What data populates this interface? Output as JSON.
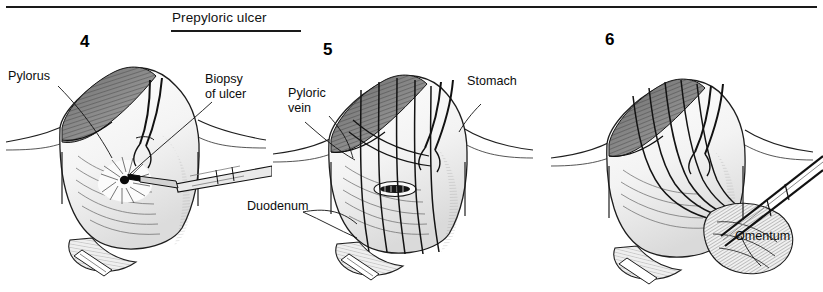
{
  "figure": {
    "title": "Prepyloric ulcer",
    "panels": [
      {
        "number": "4",
        "labels": [
          {
            "name": "pylorus",
            "text": "Pylorus"
          },
          {
            "name": "biopsy-of-ulcer",
            "text": "Biopsy\nof ulcer"
          }
        ]
      },
      {
        "number": "5",
        "labels": [
          {
            "name": "pyloric-vein",
            "text": "Pyloric\nvein"
          },
          {
            "name": "stomach",
            "text": "Stomach"
          },
          {
            "name": "duodenum",
            "text": "Duodenum"
          }
        ]
      },
      {
        "number": "6",
        "labels": [
          {
            "name": "omentum",
            "text": "Omentum"
          }
        ]
      }
    ]
  },
  "colors": {
    "ink": "#1a1a1a",
    "paper": "#ffffff",
    "shade_light": "#f2f2f2",
    "shade_mid": "#d8d8d8",
    "shade_dark": "#8c8c8c"
  }
}
